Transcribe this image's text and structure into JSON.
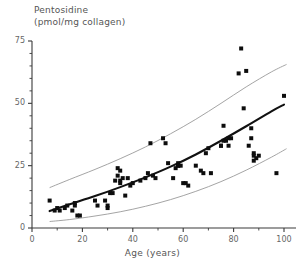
{
  "chart_data": {
    "type": "scatter",
    "title": "",
    "ylabel": "Pentosidine (pmol/mg collagen)",
    "ylabel_lines": [
      "Pentosidine",
      "(pmol/mg collagen)"
    ],
    "xlabel": "Age (years)",
    "xlim": [
      0,
      105
    ],
    "ylim": [
      0,
      75
    ],
    "xticks": [
      0,
      20,
      40,
      60,
      80,
      100
    ],
    "xtick_labels": [
      "0",
      "20",
      "40",
      "60",
      "80",
      "100"
    ],
    "xminor_ticks": [
      10,
      30,
      50,
      70,
      90
    ],
    "yticks": [
      0,
      25,
      50,
      75
    ],
    "ytick_labels": [
      "0",
      "25",
      "50",
      "75"
    ],
    "yminor_ticks": [
      5,
      10,
      15,
      20,
      30,
      35,
      40,
      45,
      55,
      60,
      65,
      70
    ],
    "grid": false,
    "legend": null,
    "marker": "square",
    "marker_color": "#0d0d0d",
    "fit_line_color": "#111111",
    "band_line_color": "#9a9a9a",
    "axis_color": "#3a3a3a",
    "series": [
      {
        "name": "Pentosidine vs Age",
        "x": [
          7,
          9,
          10,
          11,
          13,
          14,
          16,
          17,
          17,
          18,
          19,
          25,
          26,
          29,
          30,
          30,
          31,
          32,
          33,
          34,
          34,
          35,
          35,
          35,
          36,
          37,
          38,
          39,
          40,
          43,
          45,
          46,
          47,
          48,
          49,
          52,
          53,
          54,
          56,
          57,
          58,
          58,
          58,
          59,
          60,
          61,
          62,
          65,
          67,
          68,
          69,
          70,
          71,
          75,
          75,
          76,
          76,
          77,
          78,
          78,
          79,
          82,
          83,
          84,
          85,
          86,
          87,
          87,
          88,
          88,
          88,
          89,
          90,
          97,
          100
        ],
        "y": [
          11,
          7,
          8,
          7,
          8,
          9,
          7,
          10,
          9,
          5,
          5,
          11,
          9,
          11,
          9,
          8,
          14,
          14,
          19,
          21,
          24,
          23,
          19,
          18,
          20,
          13,
          20,
          17,
          18,
          19,
          20,
          22,
          34,
          21,
          20,
          36,
          34,
          26,
          20,
          24,
          26,
          25,
          25,
          25,
          18,
          18,
          17,
          25,
          23,
          22,
          30,
          32,
          22,
          33,
          33,
          41,
          35,
          35,
          36,
          33,
          36,
          62,
          72,
          48,
          63,
          33,
          40,
          36,
          30,
          29,
          27,
          28,
          29,
          22,
          53
        ],
        "n_points": 75
      }
    ],
    "fit_curve": {
      "name": "regression fit",
      "x": [
        7,
        15,
        25,
        35,
        45,
        55,
        65,
        75,
        85,
        95,
        100
      ],
      "y": [
        6.8,
        9.5,
        12.8,
        16.4,
        20.3,
        24.6,
        29.5,
        35.0,
        40.8,
        46.8,
        49.5
      ]
    },
    "upper_band": {
      "name": "upper confidence band",
      "x": [
        7,
        15,
        25,
        35,
        45,
        55,
        65,
        75,
        85,
        95,
        101
      ],
      "y": [
        16.2,
        19.5,
        23.5,
        27.8,
        32.5,
        37.8,
        43.6,
        50.0,
        56.6,
        62.6,
        65.6
      ]
    },
    "lower_band": {
      "name": "lower confidence band",
      "x": [
        7,
        15,
        25,
        35,
        45,
        55,
        65,
        75,
        85,
        95,
        101
      ],
      "y": [
        2.6,
        3.4,
        4.8,
        6.5,
        8.7,
        11.4,
        14.7,
        18.6,
        23.2,
        28.4,
        31.8
      ]
    }
  }
}
